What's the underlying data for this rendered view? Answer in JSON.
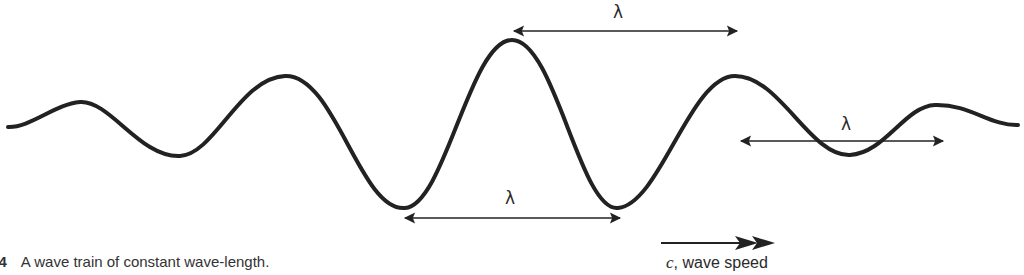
{
  "figure": {
    "number": "6.4",
    "caption": "A wave train of constant wave-length.",
    "wavelength_symbol": "λ",
    "speed_label": {
      "symbol": "c",
      "text": ", wave speed"
    },
    "stroke_color": "#222222"
  },
  "annotations": [
    {
      "name": "wavelength-crest-to-crest",
      "label": "λ",
      "from_x": 512,
      "to_x": 738,
      "y": 31
    },
    {
      "name": "wavelength-trough-to-trough",
      "label": "λ",
      "from_x": 405,
      "to_x": 620,
      "y": 217
    },
    {
      "name": "wavelength-node-to-node",
      "label": "λ",
      "from_x": 740,
      "to_x": 944,
      "y": 141
    }
  ]
}
